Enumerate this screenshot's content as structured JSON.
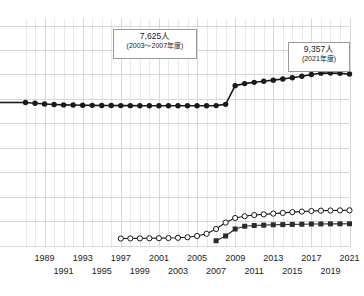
{
  "chart_data": {
    "type": "line",
    "title": "",
    "xlabel": "",
    "ylabel": "",
    "grid": true,
    "legend": "none",
    "xlim": [
      1987,
      2021
    ],
    "ylim": [
      0,
      12000
    ],
    "x": [
      1987,
      1988,
      1989,
      1990,
      1991,
      1992,
      1993,
      1994,
      1995,
      1996,
      1997,
      1998,
      1999,
      2000,
      2001,
      2002,
      2003,
      2004,
      2005,
      2006,
      2007,
      2008,
      2009,
      2010,
      2011,
      2012,
      2013,
      2014,
      2015,
      2016,
      2017,
      2018,
      2019,
      2020,
      2021
    ],
    "series": [
      {
        "name": "総数",
        "marker": "filled-circle",
        "color": "#1a1a1a",
        "values": [
          7800,
          7760,
          7720,
          7690,
          7670,
          7660,
          7650,
          7645,
          7640,
          7635,
          7630,
          7628,
          7626,
          7625,
          7625,
          7625,
          7625,
          7625,
          7625,
          7625,
          7630,
          7700,
          8720,
          8830,
          8900,
          8960,
          9020,
          9080,
          9150,
          9230,
          9330,
          9400,
          9410,
          9390,
          9357
        ]
      },
      {
        "name": "系列2",
        "marker": "open-circle",
        "color": "#1a1a1a",
        "start_year": 1997,
        "values": [
          null,
          null,
          null,
          null,
          null,
          null,
          null,
          null,
          null,
          null,
          380,
          385,
          390,
          395,
          400,
          405,
          420,
          450,
          520,
          640,
          900,
          1250,
          1500,
          1600,
          1660,
          1700,
          1740,
          1780,
          1820,
          1850,
          1880,
          1900,
          1910,
          1915,
          1920
        ]
      },
      {
        "name": "系列3",
        "marker": "filled-square",
        "color": "#2b2b2b",
        "start_year": 2007,
        "values": [
          null,
          null,
          null,
          null,
          null,
          null,
          null,
          null,
          null,
          null,
          null,
          null,
          null,
          null,
          null,
          null,
          null,
          null,
          null,
          null,
          260,
          520,
          900,
          1050,
          1090,
          1110,
          1130,
          1140,
          1150,
          1160,
          1170,
          1175,
          1180,
          1182,
          1185
        ]
      }
    ],
    "annotations": [
      {
        "id": "a1",
        "value": "7,625人",
        "period": "(2003〜2007年度)"
      },
      {
        "id": "a2",
        "value": "9,357人",
        "period": "(2021年度)"
      }
    ],
    "x_tick_labels_upper": [
      "1989",
      "1993",
      "1997",
      "2001",
      "2005",
      "2009",
      "2013",
      "2017",
      "2021"
    ],
    "x_tick_labels_lower": [
      "1991",
      "1995",
      "1999",
      "2003",
      "2007",
      "2011",
      "2015",
      "2019"
    ],
    "colors": {
      "grid": "#e2e2e2",
      "grid_major": "#d8d8d8",
      "line": "#1a1a1a",
      "text": "#1a1a1a",
      "box_border": "#9a9a9a",
      "background": "#ffffff"
    }
  }
}
